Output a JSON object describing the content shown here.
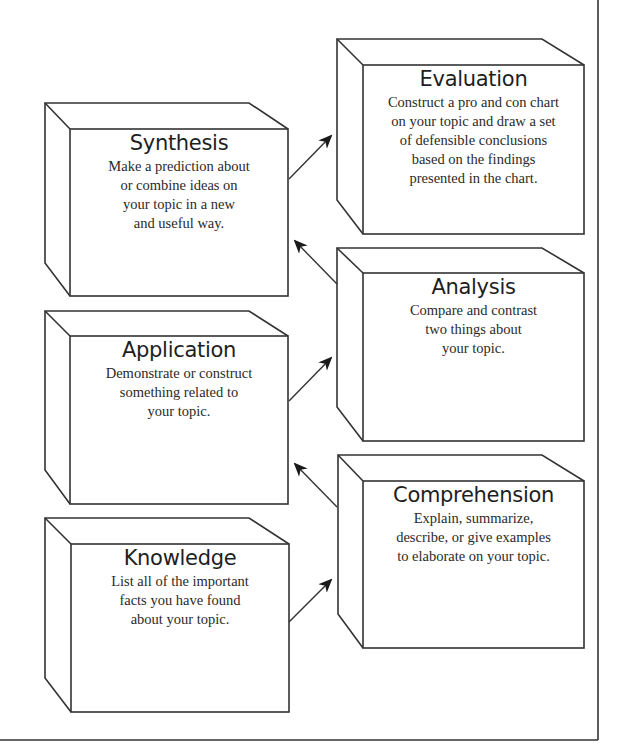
{
  "diagram": {
    "type": "hierarchy-flow",
    "colors": {
      "line": "#333333",
      "background": "#ffffff",
      "text": "#222222"
    },
    "boxes": [
      {
        "id": "evaluation",
        "title": "Evaluation",
        "body": "Construct a pro and con chart\non your topic and draw a set\nof defensible conclusions\nbased on the findings\npresented in the chart."
      },
      {
        "id": "synthesis",
        "title": "Synthesis",
        "body": "Make a prediction about\nor combine ideas on\nyour topic in a new\nand useful way."
      },
      {
        "id": "analysis",
        "title": "Analysis",
        "body": "Compare and contrast\ntwo things about\nyour topic."
      },
      {
        "id": "application",
        "title": "Application",
        "body": "Demonstrate or construct\nsomething related to\nyour topic."
      },
      {
        "id": "comprehension",
        "title": "Comprehension",
        "body": "Explain, summarize,\ndescribe, or give examples\nto elaborate on your topic."
      },
      {
        "id": "knowledge",
        "title": "Knowledge",
        "body": "List all of the important\nfacts you have found\nabout your topic."
      }
    ],
    "arrows": [
      {
        "from": "knowledge",
        "to": "comprehension"
      },
      {
        "from": "comprehension",
        "to": "application"
      },
      {
        "from": "application",
        "to": "analysis"
      },
      {
        "from": "analysis",
        "to": "synthesis"
      },
      {
        "from": "synthesis",
        "to": "evaluation"
      }
    ]
  }
}
